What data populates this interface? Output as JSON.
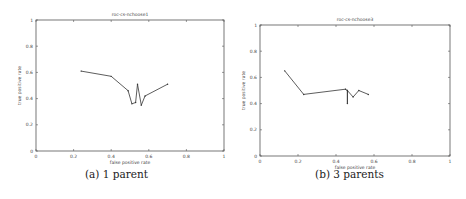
{
  "chart_data": [
    {
      "type": "line",
      "title": "roc-cs-nchoose1",
      "xlabel": "false positive rate",
      "ylabel": "true positive rate",
      "xlim": [
        0,
        1
      ],
      "ylim": [
        0,
        1
      ],
      "xticks": [
        "0",
        "0.2",
        "0.4",
        "0.6",
        "0.8",
        "1"
      ],
      "yticks": [
        "0",
        "0.2",
        "0.4",
        "0.6",
        "0.8",
        "1"
      ],
      "grid": false,
      "series": [
        {
          "name": "ROC",
          "x": [
            0.24,
            0.4,
            0.49,
            0.51,
            0.53,
            0.54,
            0.56,
            0.58,
            0.7
          ],
          "y": [
            0.61,
            0.57,
            0.46,
            0.36,
            0.37,
            0.51,
            0.35,
            0.42,
            0.51
          ]
        }
      ],
      "caption": "(a) 1 parent"
    },
    {
      "type": "line",
      "title": "roc-cs-nchoose3",
      "xlabel": "false positive rate",
      "ylabel": "true positive rate",
      "xlim": [
        0,
        1
      ],
      "ylim": [
        0,
        1
      ],
      "xticks": [
        "0",
        "0.2",
        "0.4",
        "0.6",
        "0.8",
        "1"
      ],
      "yticks": [
        "0",
        "0.2",
        "0.4",
        "0.6",
        "0.8",
        "1"
      ],
      "grid": false,
      "series": [
        {
          "name": "ROC",
          "x": [
            0.13,
            0.23,
            0.45,
            0.46,
            0.46,
            0.46,
            0.49,
            0.52,
            0.57
          ],
          "y": [
            0.65,
            0.47,
            0.51,
            0.5,
            0.4,
            0.5,
            0.45,
            0.5,
            0.47
          ]
        }
      ],
      "caption": "(b) 3 parents"
    }
  ],
  "colors": {
    "line": "#333333",
    "axis": "#555555",
    "text": "#444444"
  }
}
